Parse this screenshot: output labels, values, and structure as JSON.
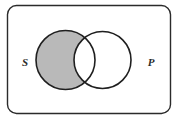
{
  "figure": {
    "name": "categorical-proposition-venn-diagram",
    "type": "venn-diagram",
    "background_color": "#ffffff"
  },
  "frame": {
    "name": "universe-box",
    "shape": "rounded-rectangle",
    "x": 7.5,
    "y": 5.5,
    "width": 163,
    "height": 108,
    "corner_radius": 9,
    "stroke_color": "#2b2b2b",
    "stroke_width": 1.4,
    "fill_color": "#ffffff"
  },
  "circles": [
    {
      "name": "circle-s",
      "label": "S",
      "cx": 65.5,
      "cy": 60,
      "r": 29.5,
      "stroke_color": "#1f1f1f",
      "stroke_width": 1.6,
      "fill_color": "none"
    },
    {
      "name": "circle-p",
      "label": "P",
      "cx": 102.5,
      "cy": 60,
      "r": 28.5,
      "stroke_color": "#1f1f1f",
      "stroke_width": 1.6,
      "fill_color": "none"
    }
  ],
  "shaded_region": {
    "name": "s-minus-p",
    "region": "S not P",
    "fill_color": "#b9b9b9",
    "shaded": true
  },
  "unshaded_regions": [
    {
      "name": "s-and-p",
      "region": "S and P",
      "fill_color": "#ffffff"
    },
    {
      "name": "p-minus-s",
      "region": "P not S",
      "fill_color": "#ffffff"
    },
    {
      "name": "outside-both",
      "region": "neither S nor P",
      "fill_color": "#ffffff"
    }
  ],
  "labels": {
    "left": {
      "name": "label-s",
      "text": "S",
      "x": 25,
      "y": 63
    },
    "right": {
      "name": "label-p",
      "text": "P",
      "x": 151,
      "y": 63
    }
  }
}
